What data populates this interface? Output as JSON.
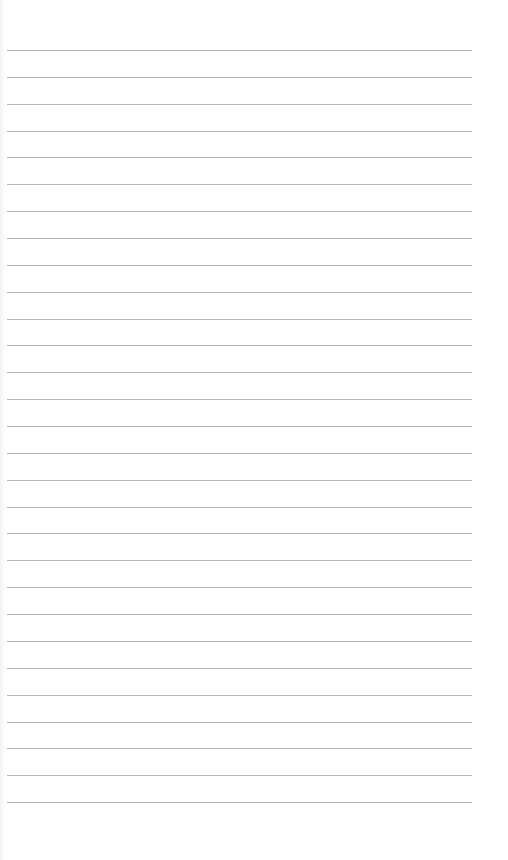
{
  "page": {
    "type": "blank-lined-paper",
    "background_color": "#ffffff",
    "line_color": "#a9a9a9",
    "line_count": 29,
    "first_line_y": 50,
    "line_spacing": 26.86,
    "line_left": 7,
    "line_width": 465,
    "text": ""
  }
}
